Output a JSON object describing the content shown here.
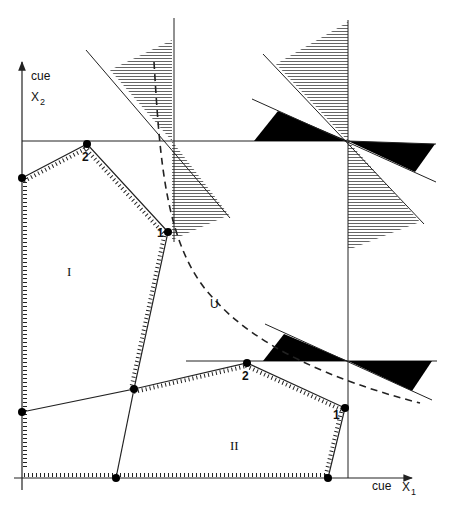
{
  "axes": {
    "y_axis": {
      "label_top": "cue",
      "label_main": "X",
      "label_sub": "2"
    },
    "x_axis": {
      "label_top": "cue",
      "label_main": "X",
      "label_sub": "1"
    }
  },
  "regions": {
    "region_I": "I",
    "region_II": "II",
    "region_U": "U"
  },
  "vertex_labels": {
    "upper_poly_v1": "1",
    "upper_poly_v2": "2",
    "lower_poly_v1": "1",
    "lower_poly_v2": "2"
  },
  "colors": {
    "line": "#222222",
    "hatch": "#555555",
    "fill_solid": "#000000",
    "background": "#ffffff"
  }
}
